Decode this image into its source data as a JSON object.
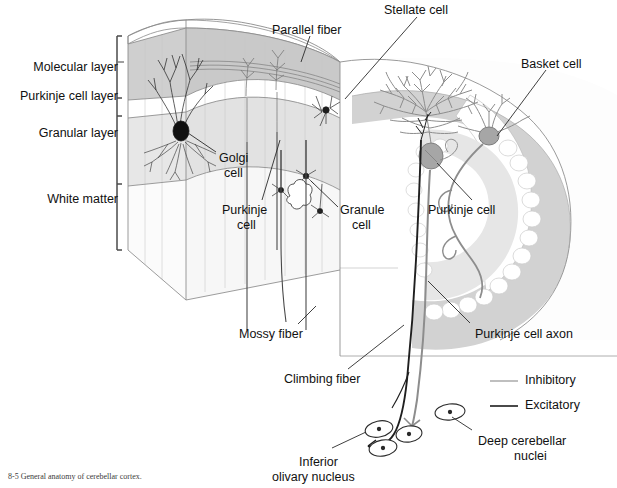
{
  "figure": {
    "title": "General anatomy of cerebellar cortex",
    "caption": "8-5  General anatomy of cerebellar cortex."
  },
  "layer_labels": [
    {
      "id": "molecular-layer",
      "text": "Molecular layer",
      "x": 118,
      "y": 60
    },
    {
      "id": "purkinje-cell-layer",
      "text": "Purkinje cell layer",
      "x": 118,
      "y": 89
    },
    {
      "id": "granular-layer",
      "text": "Granular layer",
      "x": 118,
      "y": 126
    },
    {
      "id": "white-matter",
      "text": "White matter",
      "x": 118,
      "y": 192
    }
  ],
  "structure_labels": [
    {
      "id": "parallel-fiber",
      "text": "Parallel fiber",
      "x": 272,
      "y": 23
    },
    {
      "id": "stellate-cell",
      "text": "Stellate cell",
      "x": 384,
      "y": 3
    },
    {
      "id": "basket-cell",
      "text": "Basket cell",
      "x": 521,
      "y": 57
    },
    {
      "id": "golgi-cell-line1",
      "text": "Golgi",
      "x": 219,
      "y": 151
    },
    {
      "id": "golgi-cell-line2",
      "text": "cell",
      "x": 224,
      "y": 166
    },
    {
      "id": "purkinje-cell-left-line1",
      "text": "Purkinje",
      "x": 222,
      "y": 203
    },
    {
      "id": "purkinje-cell-left-line2",
      "text": "cell",
      "x": 237,
      "y": 218
    },
    {
      "id": "granule-cell-line1",
      "text": "Granule",
      "x": 340,
      "y": 203
    },
    {
      "id": "granule-cell-line2",
      "text": "cell",
      "x": 352,
      "y": 218
    },
    {
      "id": "purkinje-cell-main",
      "text": "Purkinje cell",
      "x": 428,
      "y": 203
    },
    {
      "id": "purkinje-cell-axon",
      "text": "Purkinje cell axon",
      "x": 475,
      "y": 327
    },
    {
      "id": "mossy-fiber",
      "text": "Mossy fiber",
      "x": 239,
      "y": 327
    },
    {
      "id": "climbing-fiber",
      "text": "Climbing fiber",
      "x": 284,
      "y": 372
    },
    {
      "id": "inferior-olivary-line1",
      "text": "Inferior",
      "x": 299,
      "y": 455
    },
    {
      "id": "inferior-olivary-line2",
      "text": "olivary  nucleus",
      "x": 272,
      "y": 470
    },
    {
      "id": "deep-cerebellar-line1",
      "text": "Deep cerebellar",
      "x": 478,
      "y": 434
    },
    {
      "id": "deep-cerebellar-line2",
      "text": "nuclei",
      "x": 514,
      "y": 449
    }
  ],
  "legend": {
    "items": [
      {
        "id": "inhibitory",
        "label": "Inhibitory",
        "color": "#b4b4b4",
        "x": 525,
        "y": 373,
        "line_y": 381
      },
      {
        "id": "excitatory",
        "label": "Excitatory",
        "color": "#2a2a2a",
        "x": 525,
        "y": 398,
        "line_y": 406
      }
    ],
    "line_x1": 490,
    "line_x2": 518
  },
  "colors": {
    "molecular_layer_fill": "#cfcfcf",
    "molecular_layer_top": "#d9d9d9",
    "purkinje_layer_fill": "#ffffff",
    "granular_layer_fill": "#e8e8e8",
    "white_matter_fill": "#fcfcfc",
    "cortex_gray": "#d2d2d2",
    "cortex_light": "#eaeaea",
    "outline": "#555555",
    "neuron_dark": "#222222",
    "neuron_gray": "#808080",
    "purkinje_soma": "#9a9a9a",
    "text": "#111111"
  }
}
